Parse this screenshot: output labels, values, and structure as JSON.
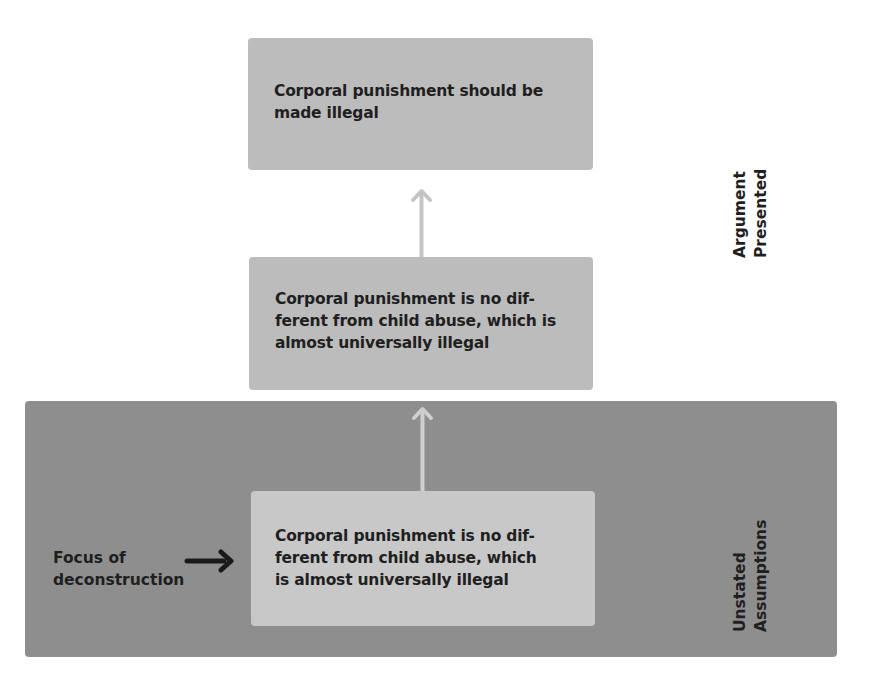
{
  "diagram": {
    "top_box": {
      "text": "Corporal punishment should be\nmade illegal"
    },
    "middle_box": {
      "text": "Corporal punishment is no dif-\nferent from child abuse, which is\nalmost universally illegal"
    },
    "inner_box": {
      "text": "Corporal punishment is no dif-\nferent from child abuse, which\nis almost universally illegal"
    },
    "focus_label": "Focus of\ndeconstruction",
    "side_labels": {
      "argument": "Argument\nPresented",
      "unstated": "Unstated\nAssumptions"
    },
    "icons": {
      "up_arrow": "up-arrow-icon",
      "right_arrow": "right-arrow-icon"
    },
    "colors": {
      "argument_box": "#bcbcbc",
      "unstated_region": "#8e8e8e",
      "inner_box": "#c8c8c8",
      "connector_arrow": "#c4c4c4",
      "text": "#1f1f1f"
    }
  }
}
